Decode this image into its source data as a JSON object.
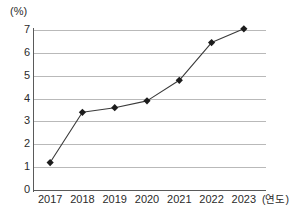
{
  "chart_data": {
    "type": "line",
    "title": "",
    "subtitle": "",
    "xlabel": "(연도)",
    "ylabel": "(%)",
    "categories": [
      "2017",
      "2018",
      "2019",
      "2020",
      "2021",
      "2022",
      "2023"
    ],
    "values": [
      1.2,
      3.4,
      3.6,
      3.9,
      4.8,
      6.45,
      7.05
    ],
    "series": [
      {
        "name": "",
        "values": [
          1.2,
          3.4,
          3.6,
          3.9,
          4.8,
          6.45,
          7.05
        ]
      }
    ],
    "ylim": [
      0,
      7
    ],
    "yticks": [
      0,
      1,
      2,
      3,
      4,
      5,
      6,
      7
    ],
    "ytick_labels": [
      "0",
      "1",
      "2",
      "3",
      "4",
      "5",
      "6",
      "7"
    ],
    "grid": "horizontal",
    "legend": "none",
    "marker": "diamond",
    "line_color": "#3a3a3a",
    "marker_color": "#1c1c1c",
    "grid_color": "#b9b9b9",
    "axis_color": "#5a5a5a",
    "text_color": "#2b2b2b"
  },
  "axes": {
    "y_unit_label": "(%)",
    "x_unit_label": "(연도)"
  }
}
